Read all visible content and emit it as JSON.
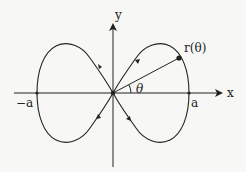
{
  "diagram": {
    "type": "parametric-curve-figure-eight",
    "axes": {
      "x_label": "x",
      "y_label": "y"
    },
    "points": {
      "positive_a_label": "a",
      "negative_a_label": "−a",
      "position_label": "r(θ)"
    },
    "angle_label": "θ",
    "colors": {
      "ink": "#222222",
      "background": "#f7f7f5"
    }
  }
}
